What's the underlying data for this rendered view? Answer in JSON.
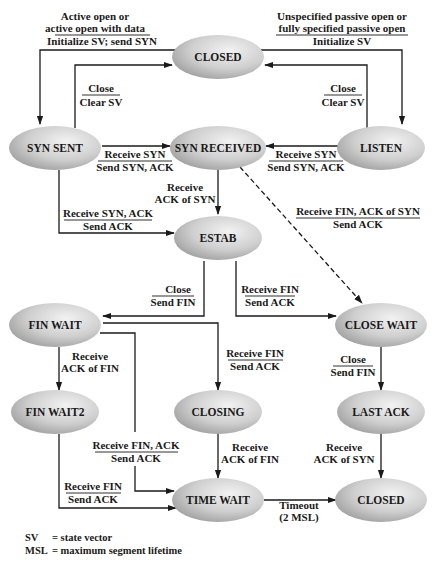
{
  "diagram": {
    "states": {
      "closed_top": "CLOSED",
      "syn_sent": "SYN SENT",
      "syn_received": "SYN RECEIVED",
      "listen": "LISTEN",
      "estab": "ESTAB",
      "fin_wait": "FIN WAIT",
      "close_wait": "CLOSE WAIT",
      "fin_wait2": "FIN WAIT2",
      "closing": "CLOSING",
      "last_ack": "LAST ACK",
      "time_wait": "TIME WAIT",
      "closed_bottom": "CLOSED"
    },
    "transitions": {
      "active_open": {
        "event_1": "Active open or",
        "event_2": "active open with data",
        "action": "Initialize SV; send SYN"
      },
      "passive_open": {
        "event_1": "Unspecified passive open or",
        "event_2": "fully specified passive open",
        "action": "Initialize SV"
      },
      "synsent_close": {
        "event": "Close",
        "action": "Clear SV"
      },
      "listen_close": {
        "event": "Close",
        "action": "Clear SV"
      },
      "synsent_to_synrcvd": {
        "event": "Receive SYN",
        "action": "Send SYN, ACK"
      },
      "listen_to_synrcvd": {
        "event": "Receive SYN",
        "action": "Send SYN, ACK"
      },
      "synrcvd_to_estab": {
        "line_1": "Receive",
        "line_2": "ACK of SYN"
      },
      "synsent_to_estab": {
        "event": "Receive SYN, ACK",
        "action": "Send ACK"
      },
      "synrcvd_to_closewait": {
        "event": "Receive FIN, ACK of SYN",
        "action": "Send ACK"
      },
      "estab_to_finwait": {
        "event": "Close",
        "action": "Send FIN"
      },
      "estab_to_closewait": {
        "event": "Receive FIN",
        "action": "Send ACK"
      },
      "finwait_to_finwait2": {
        "line_1": "Receive",
        "line_2": "ACK of FIN"
      },
      "finwait_to_closing": {
        "event": "Receive FIN",
        "action": "Send ACK"
      },
      "closewait_to_lastack": {
        "event": "Close",
        "action": "Send FIN"
      },
      "finwait_to_timewait": {
        "event": "Receive FIN, ACK",
        "action": "Send ACK"
      },
      "closing_to_timewait": {
        "line_1": "Receive",
        "line_2": "ACK of FIN"
      },
      "lastack_to_closed": {
        "line_1": "Receive",
        "line_2": "ACK of SYN"
      },
      "finwait2_to_timewait": {
        "event": "Receive FIN",
        "action": "Send ACK"
      },
      "timewait_to_closed": {
        "line_1": "Timeout",
        "line_2": "(2 MSL)"
      }
    },
    "legend": [
      {
        "abbr": "SV",
        "definition": "= state vector"
      },
      {
        "abbr": "MSL",
        "definition": "= maximum segment lifetime"
      }
    ],
    "colors": {
      "state_fill_light": "#e6e6e6",
      "state_fill_dark": "#9a9a9a",
      "line": "#1a1a1a",
      "text": "#1a1a1a"
    }
  }
}
